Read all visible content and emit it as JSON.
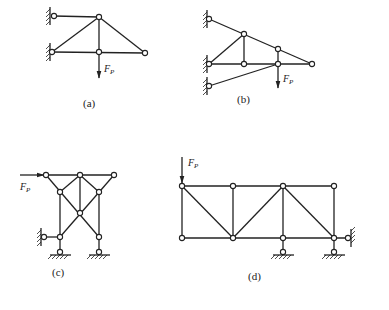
{
  "figure": {
    "panels": [
      {
        "id": "a",
        "caption": "(a)",
        "load_label": "F",
        "load_subscript": "P"
      },
      {
        "id": "b",
        "caption": "(b)",
        "load_label": "F",
        "load_subscript": "P"
      },
      {
        "id": "c",
        "caption": "(c)",
        "load_label": "F",
        "load_subscript": "P"
      },
      {
        "id": "d",
        "caption": "(d)",
        "load_label": "F",
        "load_subscript": "P"
      }
    ]
  }
}
